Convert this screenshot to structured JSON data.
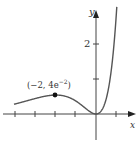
{
  "chart_data": {
    "type": "line",
    "title": "",
    "function": "y = x^2 e^x",
    "xlabel": "x",
    "ylabel": "y",
    "xlim": [
      -4.1,
      2.2
    ],
    "ylim": [
      -1.3,
      3.2
    ],
    "x_ticks": [
      -4,
      -3,
      -2,
      -1,
      0,
      1
    ],
    "y_ticks": [
      1,
      2
    ],
    "y_tick_labels": [
      "",
      "2"
    ],
    "annotations": [
      {
        "x": -2,
        "y": 0.5413,
        "label": "(−2, 4e⁻²)",
        "marker": "filled-circle"
      }
    ],
    "series": [
      {
        "name": "x^2 e^x",
        "x": [
          -4.1,
          -3.5,
          -3,
          -2.5,
          -2,
          -1.5,
          -1,
          -0.5,
          0,
          0.5,
          1,
          1.3
        ],
        "values": [
          0.278,
          0.371,
          0.448,
          0.513,
          0.541,
          0.502,
          0.368,
          0.152,
          0,
          0.412,
          2.718,
          6.2
        ]
      }
    ],
    "grid": false,
    "legend": null
  },
  "labels": {
    "x_axis": "x",
    "y_axis": "y",
    "tick_2": "2",
    "point": "(−2, 4e",
    "point_exp": "−2",
    "point_close": ")"
  }
}
